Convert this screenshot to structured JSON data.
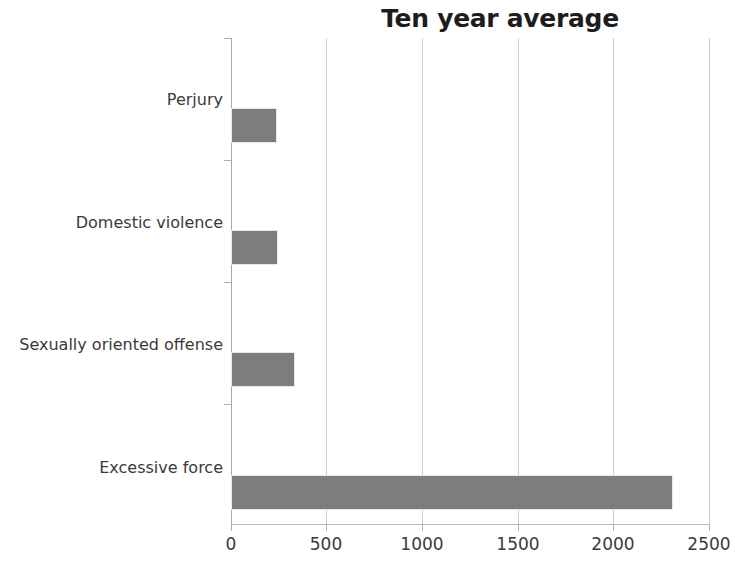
{
  "chart_data": {
    "type": "bar",
    "orientation": "horizontal",
    "title": "Ten year average",
    "xlabel": "",
    "ylabel": "",
    "categories": [
      "Perjury",
      "Domestic violence",
      "Sexually oriented offense",
      "Excessive force"
    ],
    "values": [
      230,
      235,
      325,
      2300
    ],
    "xlim": [
      0,
      2500
    ],
    "xticks": [
      0,
      500,
      1000,
      1500,
      2000,
      2500
    ],
    "xtick_labels": [
      "0",
      "500",
      "1000",
      "1500",
      "2000",
      "2500"
    ],
    "grid": true,
    "legend": false,
    "series": [
      {
        "name": "Ten year average",
        "values": [
          230,
          235,
          325,
          2300
        ]
      }
    ],
    "colors": {
      "bar": "#7d7d7d",
      "gridline": "#cfcfcf",
      "axis": "#a9a9a9",
      "text": "#3a3a3a",
      "title": "#1d1d1d",
      "background": "#ffffff"
    }
  }
}
